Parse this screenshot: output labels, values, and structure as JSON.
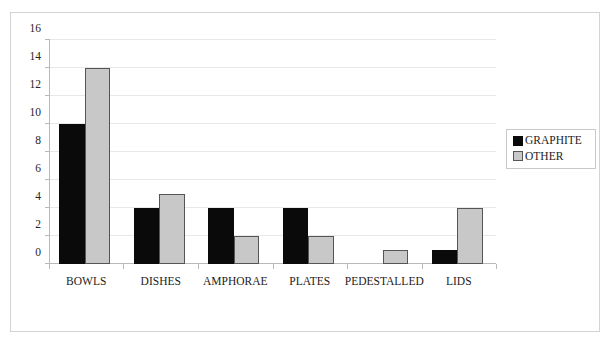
{
  "chart_data": {
    "type": "bar",
    "title": "",
    "subtitle": "",
    "xlabel": "",
    "ylabel": "",
    "ylim": [
      0,
      16
    ],
    "y_ticks": [
      0,
      2,
      4,
      6,
      8,
      10,
      12,
      14,
      16
    ],
    "y_tick_labels": [
      "0",
      "2",
      "4",
      "6",
      "8",
      "10",
      "12",
      "14",
      "16"
    ],
    "grid": true,
    "legend_position": "right",
    "categories": [
      "BOWLS",
      "DISHES",
      "AMPHORAE",
      "PLATES",
      "PEDESTALLED",
      "LIDS"
    ],
    "series": [
      {
        "name": "GRAPHITE",
        "color": "#0a0a0a",
        "values": [
          10,
          4,
          4,
          4,
          0,
          1
        ]
      },
      {
        "name": "OTHER",
        "color": "#c8c8c8",
        "values": [
          14,
          5,
          2,
          2,
          1,
          4
        ]
      }
    ]
  },
  "legend": {
    "entries": [
      {
        "label": "GRAPHITE",
        "swatch": "graphite-swatch"
      },
      {
        "label": "OTHER",
        "swatch": "other-swatch"
      }
    ]
  },
  "colors": {
    "graphite": "#0a0a0a",
    "other": "#c8c8c8",
    "gridline": "#e8e8e8",
    "axis": "#b9b9b9",
    "border": "#d3d3d3",
    "text": "#1c1c1c",
    "background": "#ffffff"
  }
}
